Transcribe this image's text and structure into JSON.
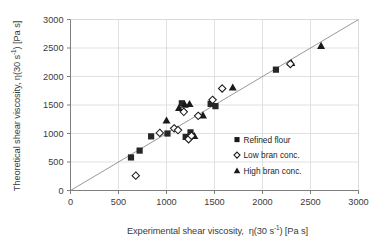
{
  "chart_data": {
    "type": "scatter",
    "title": "",
    "xlabel": "Experimental shear viscosity,  η(30 s⁻¹) [Pa s]",
    "ylabel": "Theoretical shear viscosity, η(30 s⁻¹) [Pa s]",
    "xlim": [
      0,
      3000
    ],
    "ylim": [
      0,
      3000
    ],
    "xticks": [
      0,
      500,
      1000,
      1500,
      2000,
      2500,
      3000
    ],
    "yticks": [
      0,
      500,
      1000,
      1500,
      2000,
      2500,
      3000
    ],
    "xticklabels": [
      "0",
      "500",
      "1000",
      "1500",
      "2000",
      "2500",
      "3000"
    ],
    "yticklabels": [
      "0",
      "500",
      "1000",
      "1500",
      "2000",
      "2500",
      "3000"
    ],
    "grid": true,
    "legend_position": "lower right",
    "reference_line": {
      "name": "identity-line",
      "x": [
        0,
        3000
      ],
      "y": [
        0,
        3000
      ],
      "label": "y = x"
    },
    "series": [
      {
        "name": "Refined flour",
        "marker": "filled-square",
        "color": "#262626",
        "points": [
          [
            630,
            580
          ],
          [
            720,
            700
          ],
          [
            840,
            950
          ],
          [
            1010,
            1000
          ],
          [
            1160,
            1530
          ],
          [
            1200,
            940
          ],
          [
            1250,
            1020
          ],
          [
            1460,
            1520
          ],
          [
            1510,
            1480
          ],
          [
            2140,
            2120
          ]
        ]
      },
      {
        "name": "Low bran conc.",
        "marker": "open-diamond",
        "color": "#1a1a1a",
        "points": [
          [
            680,
            260
          ],
          [
            930,
            1010
          ],
          [
            1080,
            1090
          ],
          [
            1120,
            1060
          ],
          [
            1180,
            1380
          ],
          [
            1230,
            900
          ],
          [
            1260,
            960
          ],
          [
            1330,
            1310
          ],
          [
            1480,
            1590
          ],
          [
            1580,
            1790
          ],
          [
            2290,
            2220
          ]
        ]
      },
      {
        "name": "High bran conc.",
        "marker": "filled-triangle",
        "color": "#1a1a1a",
        "points": [
          [
            1000,
            1230
          ],
          [
            1130,
            1450
          ],
          [
            1190,
            1510
          ],
          [
            1240,
            1520
          ],
          [
            1290,
            960
          ],
          [
            1380,
            1320
          ],
          [
            1690,
            1810
          ],
          [
            2300,
            2240
          ],
          [
            2610,
            2540
          ]
        ]
      }
    ]
  },
  "legend": {
    "items": [
      {
        "label": "Refined flour",
        "marker": "filled-square"
      },
      {
        "label": "Low bran conc.",
        "marker": "open-diamond"
      },
      {
        "label": "High bran conc.",
        "marker": "filled-triangle"
      }
    ]
  },
  "axes": {
    "x_label_text": "Experimental shear viscosity,  η(30 s",
    "y_label_text": "Theoretical shear viscosity, η(30 s"
  }
}
